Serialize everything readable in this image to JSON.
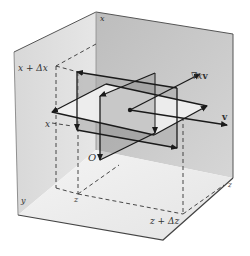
{
  "diagram": {
    "type": "3d-volume-element-curl",
    "labels": {
      "x_top": "x",
      "x_plus_dx": "x + Δx",
      "x_left": "x",
      "origin": "O",
      "y": "y",
      "z": "z",
      "z_plus_dz": "z + Δz",
      "z_right": "z",
      "curl": "∇x",
      "curl_v": "v",
      "velocity": "v"
    },
    "colors": {
      "background": "#ffffff",
      "back_wall": "#c4c4c4",
      "left_wall": "#dcdcdc",
      "floor": "#ececec",
      "edge": "#555555",
      "line": "#1a1a1a",
      "plane_light": "#efefef",
      "plane_dark": "#9a9a9a",
      "dash": "#333333"
    }
  }
}
